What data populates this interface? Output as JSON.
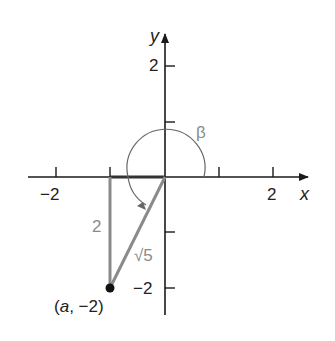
{
  "diagram": {
    "type": "coordinate-plane-angle",
    "axes": {
      "x_label": "x",
      "y_label": "y",
      "x_ticks": [
        -2,
        -1,
        1,
        2
      ],
      "y_ticks": [
        2,
        1,
        -1,
        -2
      ],
      "x_tick_labels": {
        "neg2": "−2",
        "pos2": "2"
      },
      "y_tick_labels": {
        "pos2": "2",
        "neg2": "−2"
      }
    },
    "angle": {
      "label": "β"
    },
    "triangle": {
      "vertical_side_label": "2",
      "hypotenuse_label": "√5"
    },
    "point": {
      "label": "(a, −2)",
      "a_label": "a",
      "rest_label": ", −2)",
      "open_paren": "("
    },
    "colors": {
      "axis": "#1a1a1a",
      "triangle": "#8a8a8a",
      "arc": "#666666",
      "point": "#111111",
      "label_gray": "#8a8a8a"
    }
  }
}
